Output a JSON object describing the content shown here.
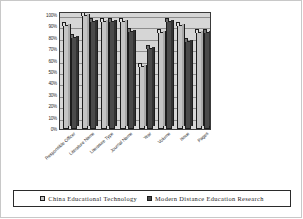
{
  "chart_data": {
    "type": "bar",
    "title": "",
    "xlabel": "",
    "ylabel": "",
    "ylim": [
      0,
      100
    ],
    "ytick_labels": [
      "100%",
      "90%",
      "80%",
      "70%",
      "60%",
      "50%",
      "40%",
      "30%",
      "20%",
      "10%",
      "0%"
    ],
    "ytick_values": [
      100,
      90,
      80,
      70,
      60,
      50,
      40,
      30,
      20,
      10,
      0
    ],
    "grid": true,
    "legend_position": "bottom",
    "categories": [
      "Responsible Officer",
      "Literature Name",
      "Literature Type",
      "Journal Name",
      "Year",
      "Volume",
      "Issue",
      "Pages"
    ],
    "series": [
      {
        "name": "China Educational Technology",
        "color": "#c4c4c4",
        "values": [
          91,
          100,
          95,
          95,
          55,
          85,
          91,
          85
        ]
      },
      {
        "name": "Modern Distance Education Research",
        "color": "#4a4a4a",
        "values": [
          81,
          95,
          95,
          86,
          71,
          95,
          77,
          85
        ]
      }
    ]
  },
  "legend": {
    "items": [
      {
        "label": "China Educational Technology",
        "swatch": "legend-swatch-series-0"
      },
      {
        "label": "Modern Distance Education Research",
        "swatch": "legend-swatch-series-1"
      }
    ]
  }
}
